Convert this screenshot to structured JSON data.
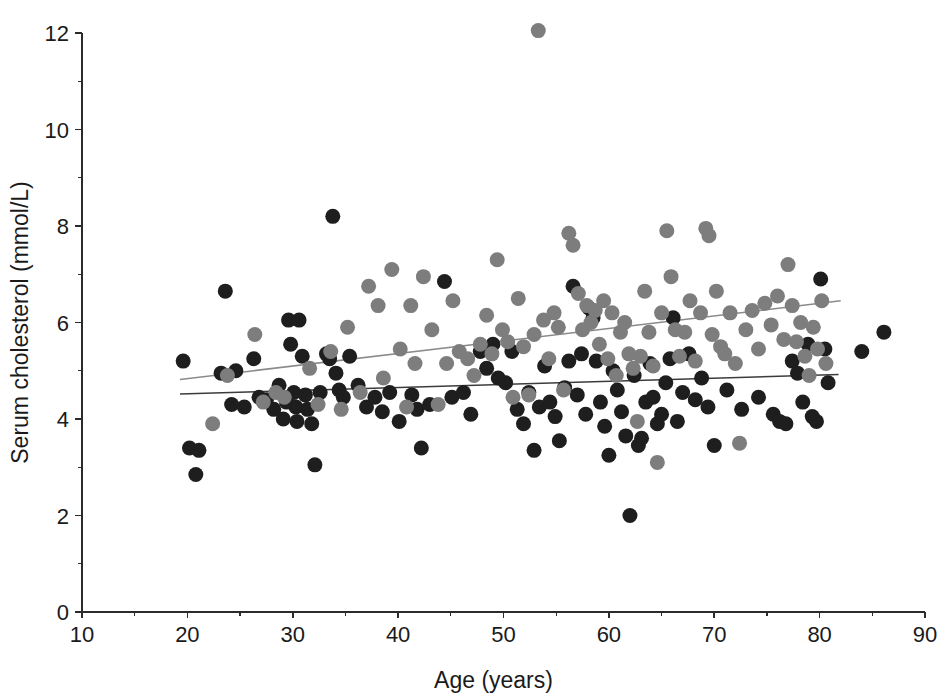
{
  "chart_data": {
    "type": "scatter",
    "title": "",
    "xlabel": "Age (years)",
    "ylabel": "Serum cholesterol (mmol/L)",
    "xlim": [
      10,
      90
    ],
    "ylim": [
      0,
      12.4
    ],
    "xticks": [
      10,
      20,
      30,
      40,
      50,
      60,
      70,
      80,
      90
    ],
    "xtick_labels": [
      "10",
      "20",
      "30",
      "40",
      "50",
      "60",
      "70",
      "80",
      "90"
    ],
    "yticks": [
      0,
      2,
      4,
      6,
      8,
      10,
      12
    ],
    "ytick_labels": [
      "0",
      "2",
      "4",
      "6",
      "8",
      "10",
      "12"
    ],
    "yminorticks": [
      1,
      3,
      5,
      7,
      9,
      11
    ],
    "xminorticks": [
      15,
      25,
      35,
      45,
      55,
      65,
      75,
      85
    ],
    "grid": false,
    "legend": null,
    "colors": {
      "group_dark": "#1e1e1e",
      "group_gray": "#7d7d7d",
      "axis": "#2b2b2b",
      "line_dark": "#3c3c3c",
      "line_gray": "#8a8a8a",
      "background": "#ffffff"
    },
    "marker": {
      "shape": "circle",
      "radius_px": 7.5
    },
    "series": [
      {
        "name": "group-dark",
        "color": "#1e1e1e",
        "points": [
          [
            19.6,
            5.2
          ],
          [
            20.2,
            3.4
          ],
          [
            20.8,
            2.85
          ],
          [
            21.1,
            3.35
          ],
          [
            23.6,
            6.65
          ],
          [
            23.2,
            4.95
          ],
          [
            24.2,
            4.3
          ],
          [
            24.6,
            5.0
          ],
          [
            25.4,
            4.25
          ],
          [
            26.3,
            5.25
          ],
          [
            26.8,
            4.45
          ],
          [
            27.5,
            4.4
          ],
          [
            28.2,
            4.2
          ],
          [
            28.7,
            4.7
          ],
          [
            29.1,
            4.0
          ],
          [
            29.4,
            4.35
          ],
          [
            29.6,
            6.05
          ],
          [
            29.8,
            5.55
          ],
          [
            30.1,
            4.55
          ],
          [
            30.3,
            4.25
          ],
          [
            30.4,
            3.95
          ],
          [
            30.6,
            6.05
          ],
          [
            30.9,
            5.3
          ],
          [
            31.2,
            4.5
          ],
          [
            31.4,
            4.2
          ],
          [
            31.8,
            3.9
          ],
          [
            32.1,
            3.05
          ],
          [
            32.6,
            4.55
          ],
          [
            33.2,
            5.35
          ],
          [
            33.5,
            5.25
          ],
          [
            33.8,
            8.2
          ],
          [
            34.1,
            4.95
          ],
          [
            34.4,
            4.6
          ],
          [
            34.8,
            4.45
          ],
          [
            35.4,
            5.3
          ],
          [
            36.2,
            4.7
          ],
          [
            37.0,
            4.25
          ],
          [
            37.8,
            4.45
          ],
          [
            38.5,
            4.15
          ],
          [
            39.2,
            4.55
          ],
          [
            40.1,
            3.95
          ],
          [
            41.3,
            4.5
          ],
          [
            41.8,
            4.2
          ],
          [
            42.2,
            3.4
          ],
          [
            43.0,
            4.3
          ],
          [
            44.4,
            6.85
          ],
          [
            45.1,
            4.45
          ],
          [
            46.2,
            4.55
          ],
          [
            46.9,
            4.1
          ],
          [
            47.8,
            5.4
          ],
          [
            48.4,
            5.05
          ],
          [
            49.0,
            5.55
          ],
          [
            49.5,
            4.85
          ],
          [
            50.2,
            4.75
          ],
          [
            50.8,
            5.4
          ],
          [
            51.3,
            4.2
          ],
          [
            51.9,
            3.9
          ],
          [
            52.4,
            4.55
          ],
          [
            52.9,
            3.35
          ],
          [
            53.4,
            4.25
          ],
          [
            53.9,
            5.1
          ],
          [
            54.4,
            4.35
          ],
          [
            54.9,
            4.05
          ],
          [
            55.3,
            3.55
          ],
          [
            55.8,
            4.65
          ],
          [
            56.2,
            5.2
          ],
          [
            56.6,
            6.75
          ],
          [
            57.0,
            4.5
          ],
          [
            57.4,
            5.35
          ],
          [
            57.8,
            4.1
          ],
          [
            58.1,
            6.3
          ],
          [
            58.5,
            6.1
          ],
          [
            58.8,
            5.2
          ],
          [
            59.2,
            4.35
          ],
          [
            59.6,
            3.85
          ],
          [
            60.0,
            3.25
          ],
          [
            60.4,
            5.0
          ],
          [
            60.8,
            4.6
          ],
          [
            61.2,
            4.15
          ],
          [
            61.6,
            3.65
          ],
          [
            62.0,
            2.0
          ],
          [
            62.4,
            4.9
          ],
          [
            62.8,
            3.45
          ],
          [
            63.1,
            3.6
          ],
          [
            63.5,
            4.35
          ],
          [
            63.9,
            5.15
          ],
          [
            64.2,
            4.45
          ],
          [
            64.6,
            3.9
          ],
          [
            65.0,
            4.1
          ],
          [
            65.4,
            4.75
          ],
          [
            65.8,
            5.25
          ],
          [
            66.1,
            6.1
          ],
          [
            66.5,
            3.95
          ],
          [
            67.0,
            4.55
          ],
          [
            67.6,
            5.35
          ],
          [
            68.2,
            4.4
          ],
          [
            68.8,
            4.85
          ],
          [
            69.4,
            4.25
          ],
          [
            70.0,
            3.45
          ],
          [
            71.2,
            4.6
          ],
          [
            72.6,
            4.2
          ],
          [
            74.2,
            4.45
          ],
          [
            75.6,
            4.1
          ],
          [
            76.2,
            3.95
          ],
          [
            76.8,
            3.9
          ],
          [
            77.4,
            5.2
          ],
          [
            77.9,
            4.95
          ],
          [
            78.4,
            4.35
          ],
          [
            78.9,
            5.55
          ],
          [
            79.3,
            4.05
          ],
          [
            79.7,
            3.95
          ],
          [
            80.1,
            6.9
          ],
          [
            80.5,
            5.45
          ],
          [
            80.8,
            4.75
          ],
          [
            84.0,
            5.4
          ],
          [
            86.1,
            5.8
          ]
        ]
      },
      {
        "name": "group-gray",
        "color": "#7d7d7d",
        "points": [
          [
            22.4,
            3.9
          ],
          [
            23.8,
            4.9
          ],
          [
            26.4,
            5.75
          ],
          [
            27.2,
            4.35
          ],
          [
            28.4,
            4.55
          ],
          [
            29.2,
            4.45
          ],
          [
            31.6,
            5.05
          ],
          [
            32.4,
            4.3
          ],
          [
            33.6,
            5.4
          ],
          [
            34.6,
            4.2
          ],
          [
            35.2,
            5.9
          ],
          [
            36.4,
            4.55
          ],
          [
            37.2,
            6.75
          ],
          [
            38.1,
            6.35
          ],
          [
            38.6,
            4.85
          ],
          [
            39.4,
            7.1
          ],
          [
            40.2,
            5.45
          ],
          [
            40.8,
            4.25
          ],
          [
            41.2,
            6.35
          ],
          [
            41.6,
            5.15
          ],
          [
            42.4,
            6.95
          ],
          [
            43.2,
            5.85
          ],
          [
            43.8,
            4.3
          ],
          [
            44.6,
            5.15
          ],
          [
            45.2,
            6.45
          ],
          [
            45.8,
            5.4
          ],
          [
            46.6,
            5.25
          ],
          [
            47.2,
            4.9
          ],
          [
            47.8,
            5.55
          ],
          [
            48.4,
            6.15
          ],
          [
            48.9,
            5.35
          ],
          [
            49.4,
            7.3
          ],
          [
            49.9,
            5.85
          ],
          [
            50.4,
            5.6
          ],
          [
            50.9,
            4.45
          ],
          [
            51.4,
            6.5
          ],
          [
            51.9,
            5.5
          ],
          [
            52.4,
            4.5
          ],
          [
            52.9,
            5.75
          ],
          [
            53.3,
            12.05
          ],
          [
            53.8,
            6.05
          ],
          [
            54.3,
            5.25
          ],
          [
            54.8,
            6.2
          ],
          [
            55.2,
            5.9
          ],
          [
            55.7,
            4.6
          ],
          [
            56.2,
            7.85
          ],
          [
            56.6,
            7.6
          ],
          [
            57.1,
            6.6
          ],
          [
            57.5,
            5.85
          ],
          [
            57.9,
            6.35
          ],
          [
            58.3,
            6.0
          ],
          [
            58.7,
            6.25
          ],
          [
            59.1,
            5.55
          ],
          [
            59.5,
            6.45
          ],
          [
            59.9,
            5.25
          ],
          [
            60.3,
            6.2
          ],
          [
            60.7,
            4.9
          ],
          [
            61.1,
            5.8
          ],
          [
            61.5,
            6.0
          ],
          [
            61.9,
            5.35
          ],
          [
            62.3,
            5.05
          ],
          [
            62.7,
            3.95
          ],
          [
            63.0,
            5.3
          ],
          [
            63.4,
            6.65
          ],
          [
            63.8,
            5.8
          ],
          [
            64.2,
            5.1
          ],
          [
            64.6,
            3.1
          ],
          [
            65.0,
            6.2
          ],
          [
            65.5,
            7.9
          ],
          [
            65.9,
            6.95
          ],
          [
            66.3,
            5.85
          ],
          [
            66.7,
            5.3
          ],
          [
            67.2,
            5.8
          ],
          [
            67.7,
            6.45
          ],
          [
            68.2,
            5.2
          ],
          [
            68.7,
            6.2
          ],
          [
            69.2,
            7.95
          ],
          [
            69.5,
            7.8
          ],
          [
            69.8,
            5.75
          ],
          [
            70.2,
            6.65
          ],
          [
            70.6,
            5.5
          ],
          [
            71.0,
            5.35
          ],
          [
            71.5,
            6.2
          ],
          [
            72.0,
            5.15
          ],
          [
            72.4,
            3.5
          ],
          [
            73.0,
            5.85
          ],
          [
            73.6,
            6.25
          ],
          [
            74.2,
            5.45
          ],
          [
            74.8,
            6.4
          ],
          [
            75.4,
            5.95
          ],
          [
            76.0,
            6.55
          ],
          [
            76.6,
            5.65
          ],
          [
            77.0,
            7.2
          ],
          [
            77.4,
            6.35
          ],
          [
            77.8,
            5.6
          ],
          [
            78.2,
            6.0
          ],
          [
            78.6,
            5.3
          ],
          [
            79.0,
            4.9
          ],
          [
            79.4,
            5.9
          ],
          [
            79.8,
            5.45
          ],
          [
            80.2,
            6.45
          ],
          [
            80.6,
            5.15
          ]
        ]
      }
    ],
    "trend_lines": [
      {
        "name": "gray-group-fit",
        "color": "#8a8a8a",
        "x0": 19.3,
        "y0": 4.82,
        "x1": 82.0,
        "y1": 6.45
      },
      {
        "name": "dark-group-fit",
        "color": "#3c3c3c",
        "x0": 19.3,
        "y0": 4.52,
        "x1": 81.8,
        "y1": 4.92
      }
    ]
  }
}
